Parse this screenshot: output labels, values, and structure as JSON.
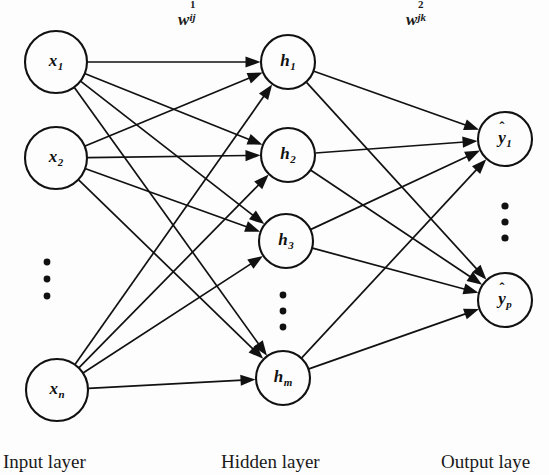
{
  "diagram": {
    "background_color": "#fdfdfd",
    "ink_color": "#111111"
  },
  "layers": {
    "input": {
      "caption": "Input layer",
      "caption_x": 3,
      "caption_y": 452,
      "nodes": [
        {
          "id": "x1",
          "base": "x",
          "sub": "1",
          "cx": 56,
          "cy": 62,
          "r": 31
        },
        {
          "id": "x2",
          "base": "x",
          "sub": "2",
          "cx": 56,
          "cy": 158,
          "r": 31
        },
        {
          "id": "xn",
          "base": "x",
          "sub": "n",
          "cx": 57,
          "cy": 390,
          "r": 31
        }
      ],
      "ellipsis": {
        "cx": 47,
        "cy_start": 262,
        "cy_step": 17,
        "count": 3,
        "r": 3.4
      }
    },
    "hidden": {
      "caption": "Hidden layer",
      "caption_x": 221,
      "caption_y": 452,
      "nodes": [
        {
          "id": "h1",
          "base": "h",
          "sub": "1",
          "cx": 288,
          "cy": 62,
          "r": 27
        },
        {
          "id": "h2",
          "base": "h",
          "sub": "2",
          "cx": 288,
          "cy": 155,
          "r": 27
        },
        {
          "id": "h3",
          "base": "h",
          "sub": "3",
          "cx": 286,
          "cy": 241,
          "r": 27
        },
        {
          "id": "hm",
          "base": "h",
          "sub": "m",
          "cx": 283,
          "cy": 378,
          "r": 27
        }
      ],
      "ellipsis": {
        "cx": 283,
        "cy_start": 295,
        "cy_step": 16,
        "count": 3,
        "r": 3.4
      }
    },
    "output": {
      "caption": "Output laye",
      "caption_x": 441,
      "caption_y": 452,
      "nodes": [
        {
          "id": "y1",
          "base": "y",
          "sub": "1",
          "hat": "̂",
          "cx": 505,
          "cy": 139,
          "r": 27
        },
        {
          "id": "yp",
          "base": "y",
          "sub": "p",
          "hat": "̂",
          "cx": 505,
          "cy": 300,
          "r": 27
        }
      ],
      "ellipsis": {
        "cx": 505,
        "cy_start": 206,
        "cy_step": 16,
        "count": 3,
        "r": 3.6
      }
    }
  },
  "weights": [
    {
      "id": "w1",
      "base": "w",
      "sup": "1",
      "sub": "ij",
      "x": 191,
      "y": 18
    },
    {
      "id": "w2",
      "base": "w",
      "sup": "2",
      "sub": "jk",
      "x": 419,
      "y": 18
    }
  ],
  "connections": {
    "input_to_hidden_description": "fully connected from every input node to every hidden node",
    "hidden_to_output_description": "fully connected from every hidden node to every output node",
    "arrowhead": "solid-triangle"
  }
}
